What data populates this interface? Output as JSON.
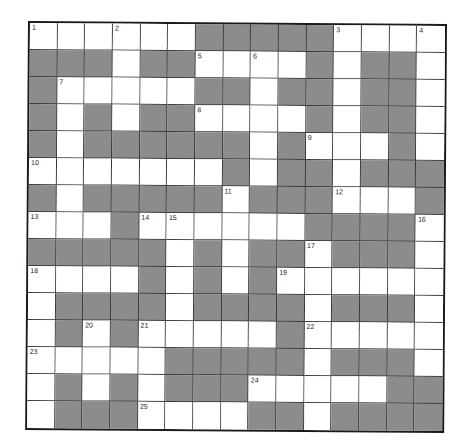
{
  "puzzle": {
    "rows": 15,
    "cols": 15,
    "colors": {
      "block": "#8c8c8c",
      "open": "#ffffff",
      "border": "#1a1a1a"
    },
    "grid": [
      ".....",
      "",
      "",
      "",
      "",
      "",
      "",
      "",
      "",
      "",
      "",
      "",
      "",
      "",
      ""
    ],
    "layout": [
      "WWWWWWBBBBBWWWW",
      "BBBWBBWWWWBWBBW",
      "BWWWWWBBWBBWBBW",
      "BWBWBBWWWWBWBBW",
      "BWBBBBBBWBWWWBW",
      "WWWWWWWBWBBWBBB",
      "BWBBBBBWBBBWWWB",
      "WWWBWWWWWWBBBBW",
      "BBBBBWBWBBWBBBW",
      "WWWWBWBWBWWWWWW",
      "WBBBBWBBBBWBBBW",
      "WBWBWWWWWBWWWWW",
      "WWWWWBBBBBWBBBW",
      "WBWBWBBBWWWWWBB",
      "WBBBWWWWBBWBBBB"
    ],
    "numbers": [
      {
        "r": 0,
        "c": 0,
        "n": "1"
      },
      {
        "r": 0,
        "c": 3,
        "n": "2"
      },
      {
        "r": 0,
        "c": 11,
        "n": "3"
      },
      {
        "r": 0,
        "c": 14,
        "n": "4"
      },
      {
        "r": 1,
        "c": 6,
        "n": "5"
      },
      {
        "r": 1,
        "c": 8,
        "n": "6"
      },
      {
        "r": 2,
        "c": 1,
        "n": "7"
      },
      {
        "r": 3,
        "c": 6,
        "n": "8"
      },
      {
        "r": 4,
        "c": 10,
        "n": "9"
      },
      {
        "r": 5,
        "c": 0,
        "n": "10"
      },
      {
        "r": 6,
        "c": 7,
        "n": "11"
      },
      {
        "r": 6,
        "c": 11,
        "n": "12"
      },
      {
        "r": 7,
        "c": 0,
        "n": "13"
      },
      {
        "r": 7,
        "c": 4,
        "n": "14"
      },
      {
        "r": 7,
        "c": 5,
        "n": "15"
      },
      {
        "r": 7,
        "c": 14,
        "n": "16"
      },
      {
        "r": 8,
        "c": 10,
        "n": "17"
      },
      {
        "r": 9,
        "c": 0,
        "n": "18"
      },
      {
        "r": 9,
        "c": 9,
        "n": "19"
      },
      {
        "r": 11,
        "c": 2,
        "n": "20"
      },
      {
        "r": 11,
        "c": 4,
        "n": "21"
      },
      {
        "r": 11,
        "c": 10,
        "n": "22"
      },
      {
        "r": 12,
        "c": 0,
        "n": "23"
      },
      {
        "r": 13,
        "c": 8,
        "n": "24"
      },
      {
        "r": 14,
        "c": 4,
        "n": "25"
      }
    ]
  }
}
